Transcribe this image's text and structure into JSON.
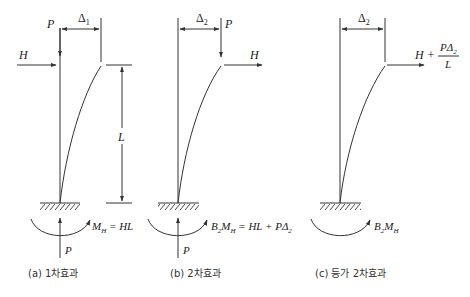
{
  "figure": {
    "panels": [
      {
        "id": "a",
        "caption": "(a) 1차효과",
        "load_vertical": "P",
        "load_horizontal": "H",
        "displacement": "Δ",
        "displacement_sub": "1",
        "height_label": "L",
        "base_reaction": "P",
        "moment_label": "M",
        "moment_sub": "H",
        "moment_eq": " = HL"
      },
      {
        "id": "b",
        "caption": "(b) 2차효과",
        "load_vertical": "P",
        "load_horizontal": "H",
        "displacement": "Δ",
        "displacement_sub": "2",
        "base_reaction": "P",
        "moment_label_B": "B",
        "moment_label_B_sub": "2",
        "moment_label_M": "M",
        "moment_sub": "H",
        "moment_eq": " = HL + PΔ",
        "moment_eq_sub": "2"
      },
      {
        "id": "c",
        "caption": "(c) 등가 2차효과",
        "displacement": "Δ",
        "displacement_sub": "2",
        "load_horizontal": "H + ",
        "load_fraction_num": "PΔ",
        "load_fraction_num_sub": "2",
        "load_fraction_den": "L",
        "moment_label_B": "B",
        "moment_label_B_sub": "2",
        "moment_label_M": "M",
        "moment_sub": "H"
      }
    ],
    "colors": {
      "line": "#333333",
      "background": "#ffffff"
    }
  }
}
